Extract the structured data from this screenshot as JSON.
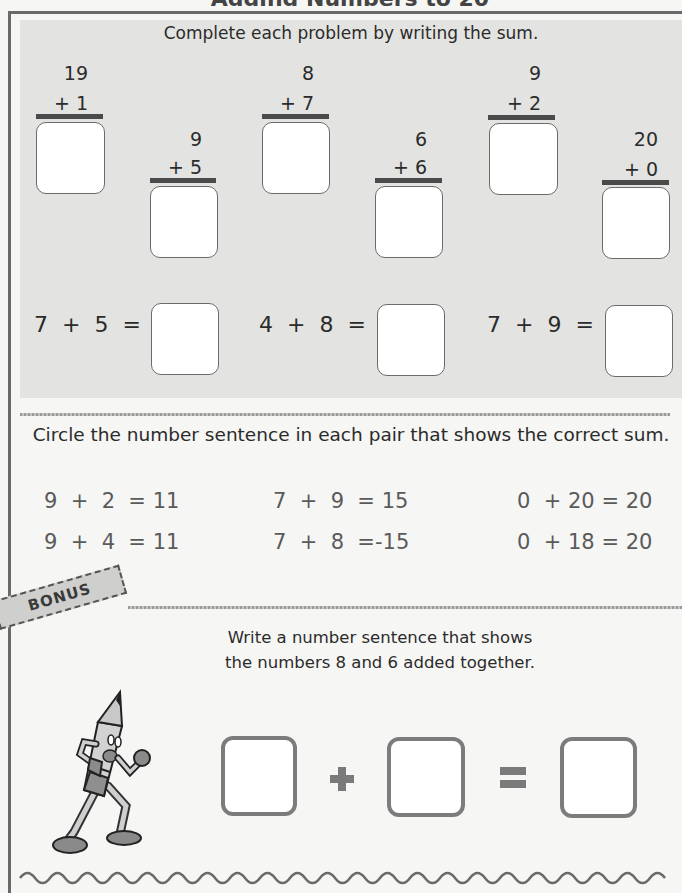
{
  "page": {
    "cropped_title": "Adding Numbers to 20"
  },
  "section1": {
    "instruction": "Complete each problem by writing the sum.",
    "vertical_problems": [
      {
        "top": "19",
        "bottom": "+ 1",
        "answer": ""
      },
      {
        "top": "9",
        "bottom": "+ 5",
        "answer": ""
      },
      {
        "top": "8",
        "bottom": "+ 7",
        "answer": ""
      },
      {
        "top": "6",
        "bottom": "+ 6",
        "answer": ""
      },
      {
        "top": "9",
        "bottom": "+ 2",
        "answer": ""
      },
      {
        "top": "20",
        "bottom": "+ 0",
        "answer": ""
      }
    ],
    "horizontal_problems": [
      {
        "expression": "7  +  5  =",
        "answer": ""
      },
      {
        "expression": "4  +  8  =",
        "answer": ""
      },
      {
        "expression": "7  +  9  =",
        "answer": ""
      }
    ]
  },
  "section2": {
    "instruction": "Circle the number sentence in each pair that shows the correct sum.",
    "pairs": [
      {
        "first": "9  +  2  = 11",
        "second": "9  +  4  = 11"
      },
      {
        "first": "7  +  9  = 15",
        "second": "7  +  8  =-15"
      },
      {
        "first": "0  + 20 = 20",
        "second": "0  + 18 = 20"
      }
    ]
  },
  "bonus": {
    "badge": "BONUS",
    "instruction_line1": "Write a number sentence that shows",
    "instruction_line2": "the numbers 8 and 6 added together.",
    "plus_symbol": "+",
    "equals_symbol": "=",
    "mascot": "pencil-character-icon"
  },
  "colors": {
    "shade": "#e3e3e1",
    "page": "#f6f6f4",
    "ink": "#2b2b2b",
    "frame": "#6a6a6a"
  }
}
